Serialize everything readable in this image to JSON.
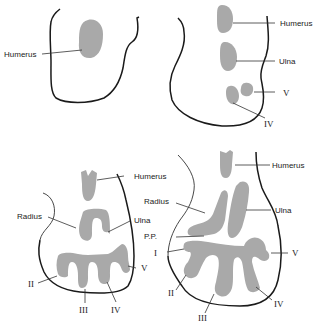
{
  "figure": {
    "panels": [
      {
        "id": "stage-1",
        "labels": [
          {
            "key": "humerus",
            "text": "Humerus"
          }
        ]
      },
      {
        "id": "stage-2",
        "labels": [
          {
            "key": "humerus",
            "text": "Humerus"
          },
          {
            "key": "ulna",
            "text": "Ulna"
          },
          {
            "key": "digit-v",
            "text": "V"
          },
          {
            "key": "digit-iv",
            "text": "IV"
          }
        ]
      },
      {
        "id": "stage-3",
        "labels": [
          {
            "key": "humerus",
            "text": "Humerus"
          },
          {
            "key": "radius",
            "text": "Radius"
          },
          {
            "key": "ulna",
            "text": "Ulna"
          },
          {
            "key": "digit-ii",
            "text": "II"
          },
          {
            "key": "digit-iii",
            "text": "III"
          },
          {
            "key": "digit-iv",
            "text": "IV"
          },
          {
            "key": "digit-v",
            "text": "V"
          }
        ]
      },
      {
        "id": "stage-4",
        "labels": [
          {
            "key": "humerus",
            "text": "Humerus"
          },
          {
            "key": "radius",
            "text": "Radius"
          },
          {
            "key": "ulna",
            "text": "Ulna"
          },
          {
            "key": "pp",
            "text": "P.P."
          },
          {
            "key": "digit-i",
            "text": "I"
          },
          {
            "key": "digit-ii",
            "text": "II"
          },
          {
            "key": "digit-iii",
            "text": "III"
          },
          {
            "key": "digit-iv",
            "text": "IV"
          },
          {
            "key": "digit-v",
            "text": "V"
          }
        ]
      }
    ],
    "colors": {
      "cartilage": "#a9a9a9",
      "outline": "#1a1a1a"
    }
  }
}
